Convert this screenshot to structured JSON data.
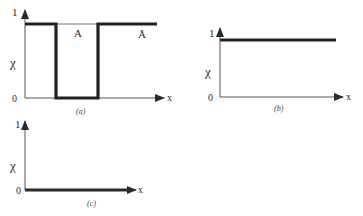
{
  "figure": {
    "panels": [
      {
        "id": "a",
        "caption": "(a)",
        "y_axis_top_label": "1",
        "y_axis_mid_label": "χ",
        "origin_label": "0",
        "x_axis_label": "x",
        "set_label": "A",
        "complement_label": "Ā",
        "description": "Characteristic function of complement of crisp set A: 1 outside A, 0 inside A"
      },
      {
        "id": "b",
        "caption": "(b)",
        "y_axis_top_label": "1",
        "y_axis_mid_label": "χ",
        "origin_label": "0",
        "x_axis_label": "x",
        "description": "Characteristic function constantly 1 (universal set)"
      },
      {
        "id": "c",
        "caption": "(c)",
        "y_axis_top_label": "1",
        "y_axis_mid_label": "χ",
        "origin_label": "0",
        "x_axis_label": "x",
        "description": "Characteristic function constantly 0 (empty set)"
      }
    ],
    "colors": {
      "ink": "#2a2a2a",
      "axis": "#555555",
      "background": "#ffffff"
    }
  }
}
